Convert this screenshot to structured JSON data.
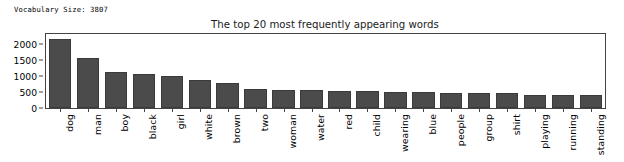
{
  "stdout": {
    "vocabulary_line": "Vocabulary Size: 3807"
  },
  "chart_data": {
    "type": "bar",
    "title": "The top 20 most frequently appearing words",
    "xlabel": "",
    "ylabel": "",
    "ylim": [
      0,
      2300
    ],
    "yticks": [
      0,
      500,
      1000,
      1500,
      2000
    ],
    "ytick_labels": [
      "0",
      "500",
      "1000",
      "1500",
      "2000"
    ],
    "grid": false,
    "legend": false,
    "bar_color": "#4b4b4b",
    "categories": [
      "dog",
      "man",
      "boy",
      "black",
      "girl",
      "white",
      "brown",
      "two",
      "woman",
      "water",
      "red",
      "child",
      "wearing",
      "blue",
      "people",
      "group",
      "shirt",
      "playing",
      "running",
      "standing"
    ],
    "values": [
      2150,
      1540,
      1120,
      1070,
      990,
      870,
      780,
      590,
      555,
      550,
      540,
      535,
      505,
      490,
      480,
      475,
      460,
      410,
      405,
      390
    ]
  }
}
